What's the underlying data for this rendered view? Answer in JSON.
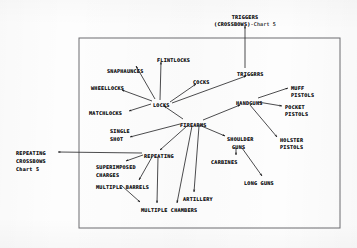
{
  "chart_data": {
    "type": "diagram",
    "subtype": "node-link tree",
    "frame": {
      "x": 79,
      "y": 38,
      "width": 261,
      "height": 190,
      "border_color": "#6d6d70"
    },
    "canvas": {
      "width": 357,
      "height": 248,
      "background": "#fdfdfd"
    },
    "nodes": [
      {
        "id": "triggers_crossbows",
        "label": "TRIGGERS",
        "suffix": "",
        "x": 245,
        "y": 14,
        "anchor": "center",
        "inside_frame": false
      },
      {
        "id": "triggers_crossbows_sub",
        "label": "(CROSSBOWS)",
        "suffix": "-Chart 5",
        "x": 245,
        "y": 21,
        "anchor": "center",
        "inside_frame": false
      },
      {
        "id": "flintlocks",
        "label": "FLINTLOCKS",
        "suffix": "",
        "x": 157,
        "y": 57,
        "anchor": "left",
        "inside_frame": true
      },
      {
        "id": "snaphaunces",
        "label": "SNAPHAUNCES",
        "suffix": "",
        "x": 107,
        "y": 68,
        "anchor": "left",
        "inside_frame": true
      },
      {
        "id": "wheellocks",
        "label": "WHEELLOCKS",
        "suffix": "",
        "x": 91,
        "y": 85,
        "anchor": "left",
        "inside_frame": true
      },
      {
        "id": "matchlocks",
        "label": "MATCHLOCKS",
        "suffix": "",
        "x": 89,
        "y": 110,
        "anchor": "left",
        "inside_frame": true
      },
      {
        "id": "locks",
        "label": "LOCKS",
        "suffix": "",
        "x": 153,
        "y": 102,
        "anchor": "left",
        "inside_frame": true
      },
      {
        "id": "cocks",
        "label": "COCKS",
        "suffix": "",
        "x": 193,
        "y": 79,
        "anchor": "left",
        "inside_frame": true
      },
      {
        "id": "triggers",
        "label": "TRIGGRRS",
        "suffix": "",
        "x": 237,
        "y": 71,
        "anchor": "left",
        "inside_frame": true
      },
      {
        "id": "handguns",
        "label": "HANDGUNS",
        "suffix": "",
        "x": 236,
        "y": 100,
        "anchor": "left",
        "inside_frame": true
      },
      {
        "id": "muff_pistols_1",
        "label": "MUFF",
        "suffix": "",
        "x": 291,
        "y": 85,
        "anchor": "left",
        "inside_frame": true
      },
      {
        "id": "muff_pistols_2",
        "label": "PISTOLS",
        "suffix": "",
        "x": 291,
        "y": 92,
        "anchor": "left",
        "inside_frame": true
      },
      {
        "id": "pocket_pistols_1",
        "label": "POCKET",
        "suffix": "",
        "x": 285,
        "y": 104,
        "anchor": "left",
        "inside_frame": true
      },
      {
        "id": "pocket_pistols_2",
        "label": "PISTOLS",
        "suffix": "",
        "x": 285,
        "y": 111,
        "anchor": "left",
        "inside_frame": true
      },
      {
        "id": "holster_pistols_1",
        "label": "HOLSTER",
        "suffix": "",
        "x": 280,
        "y": 137,
        "anchor": "left",
        "inside_frame": true
      },
      {
        "id": "holster_pistols_2",
        "label": "PISTOLS",
        "suffix": "",
        "x": 280,
        "y": 144,
        "anchor": "left",
        "inside_frame": true
      },
      {
        "id": "firearms",
        "label": "FIREARMS",
        "suffix": "",
        "x": 180,
        "y": 122,
        "anchor": "left",
        "inside_frame": true
      },
      {
        "id": "single_shot_1",
        "label": "SINGLE",
        "suffix": "",
        "x": 110,
        "y": 128,
        "anchor": "left",
        "inside_frame": true
      },
      {
        "id": "single_shot_2",
        "label": "SHOT",
        "suffix": "",
        "x": 110,
        "y": 136,
        "anchor": "left",
        "inside_frame": true
      },
      {
        "id": "shoulder_guns_1",
        "label": "SHOULDER",
        "suffix": "",
        "x": 227,
        "y": 136,
        "anchor": "left",
        "inside_frame": true
      },
      {
        "id": "shoulder_guns_2",
        "label": "GUNS",
        "suffix": "",
        "x": 232,
        "y": 144,
        "anchor": "left",
        "inside_frame": true
      },
      {
        "id": "carbines",
        "label": "CARBINES",
        "suffix": "",
        "x": 211,
        "y": 159,
        "anchor": "left",
        "inside_frame": true
      },
      {
        "id": "long_guns",
        "label": "LONG GUNS",
        "suffix": "",
        "x": 244,
        "y": 180,
        "anchor": "left",
        "inside_frame": true
      },
      {
        "id": "repeating",
        "label": "REPEATING",
        "suffix": "",
        "x": 144,
        "y": 153,
        "anchor": "left",
        "inside_frame": true
      },
      {
        "id": "superimposed_1",
        "label": "SUPERIMPOSED",
        "suffix": "",
        "x": 96,
        "y": 164,
        "anchor": "left",
        "inside_frame": true
      },
      {
        "id": "superimposed_2",
        "label": "CHARGES",
        "suffix": "",
        "x": 96,
        "y": 172,
        "anchor": "left",
        "inside_frame": true
      },
      {
        "id": "multiple_barrels",
        "label": "MULTIPLE BARRELS",
        "suffix": "",
        "x": 96,
        "y": 184,
        "anchor": "left",
        "inside_frame": true
      },
      {
        "id": "multiple_chambers",
        "label": "MULTIPLE CHAMBERS",
        "suffix": "",
        "x": 141,
        "y": 207,
        "anchor": "left",
        "inside_frame": true
      },
      {
        "id": "artillery",
        "label": "ARTILLERY",
        "suffix": "",
        "x": 183,
        "y": 196,
        "anchor": "left",
        "inside_frame": true
      },
      {
        "id": "repeating_cross_1",
        "label": "REPEATING",
        "suffix": "",
        "x": 16,
        "y": 150,
        "anchor": "left",
        "inside_frame": false
      },
      {
        "id": "repeating_cross_2",
        "label": "CROSSBOWS",
        "suffix": "",
        "x": 16,
        "y": 158,
        "anchor": "left",
        "inside_frame": false
      },
      {
        "id": "repeating_cross_3",
        "label": "Chart 5",
        "suffix": "",
        "x": 16,
        "y": 166,
        "anchor": "left",
        "inside_frame": false
      }
    ],
    "edges": [
      {
        "from": "triggers",
        "to": "triggers_crossbows",
        "x1": 245,
        "y1": 68,
        "x2": 245,
        "y2": 26,
        "arrow": "end"
      },
      {
        "from": "locks",
        "to": "flintlocks",
        "x1": 160,
        "y1": 100,
        "x2": 161,
        "y2": 62,
        "arrow": "end"
      },
      {
        "from": "locks",
        "to": "snaphaunces",
        "x1": 155,
        "y1": 99,
        "x2": 136,
        "y2": 66,
        "arrow": "end"
      },
      {
        "from": "locks",
        "to": "wheellocks",
        "x1": 152,
        "y1": 101,
        "x2": 122,
        "y2": 90,
        "arrow": "end"
      },
      {
        "from": "locks",
        "to": "matchlocks",
        "x1": 151,
        "y1": 104,
        "x2": 129,
        "y2": 111,
        "arrow": "end"
      },
      {
        "from": "locks",
        "to": "cocks",
        "x1": 170,
        "y1": 102,
        "x2": 196,
        "y2": 84,
        "arrow": "end"
      },
      {
        "from": "locks",
        "to": "triggers",
        "x1": 172,
        "y1": 103,
        "x2": 246,
        "y2": 76,
        "arrow": "end"
      },
      {
        "from": "firearms",
        "to": "locks",
        "x1": 183,
        "y1": 119,
        "x2": 164,
        "y2": 106,
        "arrow": "end"
      },
      {
        "from": "firearms",
        "to": "handguns",
        "x1": 203,
        "y1": 120,
        "x2": 240,
        "y2": 105,
        "arrow": "end"
      },
      {
        "from": "firearms",
        "to": "single_shot",
        "x1": 180,
        "y1": 124,
        "x2": 130,
        "y2": 137,
        "arrow": "end"
      },
      {
        "from": "firearms",
        "to": "shoulder_guns",
        "x1": 199,
        "y1": 125,
        "x2": 225,
        "y2": 136,
        "arrow": "end"
      },
      {
        "from": "firearms",
        "to": "repeating",
        "x1": 187,
        "y1": 126,
        "x2": 160,
        "y2": 150,
        "arrow": "end"
      },
      {
        "from": "firearms",
        "to": "multiple_chambers",
        "x1": 192,
        "y1": 126,
        "x2": 177,
        "y2": 203,
        "arrow": "end"
      },
      {
        "from": "firearms",
        "to": "artillery",
        "x1": 199,
        "y1": 126,
        "x2": 194,
        "y2": 192,
        "arrow": "end"
      },
      {
        "from": "handguns",
        "to": "muff_pistols",
        "x1": 258,
        "y1": 98,
        "x2": 288,
        "y2": 88,
        "arrow": "end"
      },
      {
        "from": "handguns",
        "to": "pocket_pistols",
        "x1": 258,
        "y1": 102,
        "x2": 282,
        "y2": 106,
        "arrow": "end"
      },
      {
        "from": "handguns",
        "to": "holster_pistols",
        "x1": 250,
        "y1": 105,
        "x2": 277,
        "y2": 137,
        "arrow": "end"
      },
      {
        "from": "shoulder_guns",
        "to": "carbines",
        "x1": 236,
        "y1": 148,
        "x2": 236,
        "y2": 155,
        "arrow": "end"
      },
      {
        "from": "shoulder_guns",
        "to": "long_guns",
        "x1": 242,
        "y1": 148,
        "x2": 262,
        "y2": 176,
        "arrow": "end"
      },
      {
        "from": "repeating",
        "to": "superimposed",
        "x1": 143,
        "y1": 155,
        "x2": 126,
        "y2": 161,
        "arrow": "end"
      },
      {
        "from": "repeating",
        "to": "multiple_barrels",
        "x1": 152,
        "y1": 157,
        "x2": 139,
        "y2": 180,
        "arrow": "end"
      },
      {
        "from": "repeating",
        "to": "multiple_chambers",
        "x1": 158,
        "y1": 157,
        "x2": 157,
        "y2": 203,
        "arrow": "end"
      },
      {
        "from": "multiple_barrels",
        "to": "multiple_chambers",
        "x1": 122,
        "y1": 186,
        "x2": 140,
        "y2": 202,
        "arrow": "end"
      },
      {
        "from": "repeating",
        "to": "repeating_crossbows",
        "x1": 142,
        "y1": 153,
        "x2": 58,
        "y2": 152,
        "arrow": "end"
      }
    ],
    "edge_count": 24,
    "node_count": 32,
    "ink_color": "#1d1d1f"
  }
}
